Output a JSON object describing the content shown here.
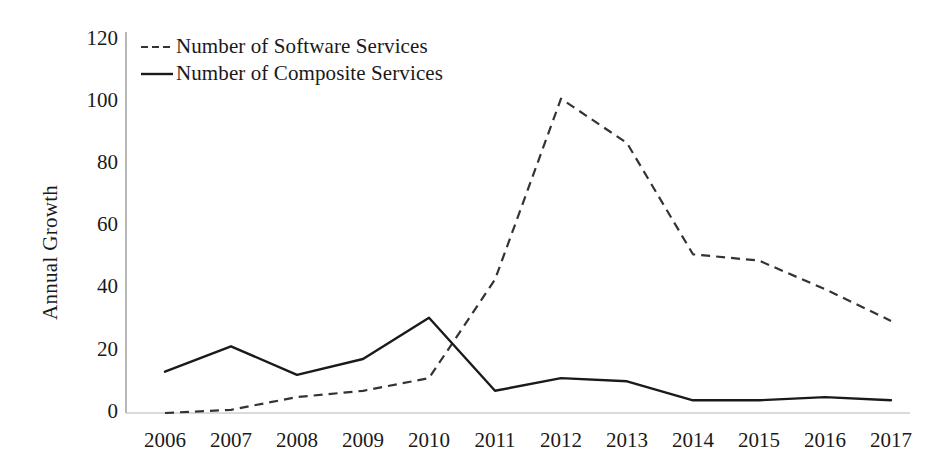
{
  "chart_data": {
    "type": "line",
    "title": "",
    "subtitle": "",
    "xlabel": "",
    "ylabel": "Annual Growth",
    "categories": [
      "2006",
      "2007",
      "2008",
      "2009",
      "2010",
      "2011",
      "2012",
      "2013",
      "2014",
      "2015",
      "2016",
      "2017"
    ],
    "series": [
      {
        "name": "Number of Software Services",
        "style": "dashed",
        "color": "#333333",
        "values": [
          0,
          1,
          5,
          7,
          11,
          42,
          99,
          85,
          50,
          48,
          39,
          29
        ]
      },
      {
        "name": "Number of Composite Services",
        "style": "solid",
        "color": "#1a1a1a",
        "values": [
          13,
          21,
          12,
          17,
          30,
          7,
          11,
          10,
          4,
          4,
          5,
          4
        ]
      }
    ],
    "ylim": [
      0,
      120
    ],
    "yticks": [
      0,
      20,
      40,
      60,
      80,
      100,
      120
    ],
    "ytick_labels": [
      "0",
      "20",
      "40",
      "60",
      "80",
      "100",
      "120"
    ],
    "grid": false,
    "legend_position": "top-left"
  },
  "legend": {
    "items": [
      {
        "label": "Number of Software Services",
        "style": "dashed"
      },
      {
        "label": "Number of Composite Services",
        "style": "solid"
      }
    ]
  },
  "axes": {
    "y_title": "Annual Growth",
    "y_ticks": [
      "120",
      "100",
      "80",
      "60",
      "40",
      "20",
      "0"
    ],
    "x_ticks": [
      "2006",
      "2007",
      "2008",
      "2009",
      "2010",
      "2011",
      "2012",
      "2013",
      "2014",
      "2015",
      "2016",
      "2017"
    ]
  },
  "colors": {
    "axis": "#9a9a9a",
    "series_software": "#333333",
    "series_composite": "#1a1a1a",
    "text": "#1a1a1a",
    "background": "#ffffff"
  }
}
